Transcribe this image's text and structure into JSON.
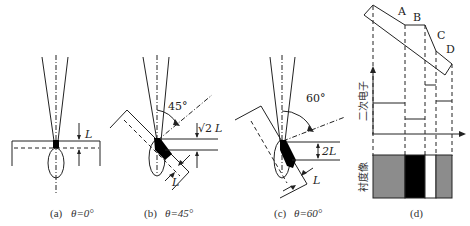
{
  "figure": {
    "panels": [
      {
        "id": "a",
        "caption_prefix": "(a)",
        "caption_theta": "θ=0°",
        "depth_label": "L"
      },
      {
        "id": "b",
        "caption_prefix": "(b)",
        "caption_theta": "θ=45°",
        "angle_label": "45°",
        "depth_label_top": "√2",
        "depth_label_top_var": "L",
        "depth_label_bottom": "L"
      },
      {
        "id": "c",
        "caption_prefix": "(c)",
        "caption_theta": "θ=60°",
        "angle_label": "60°",
        "depth_label_top": "2L",
        "depth_label_bottom": "L"
      },
      {
        "id": "d",
        "caption": "(d)",
        "surface_labels": [
          "A",
          "B",
          "C",
          "D"
        ],
        "axis_label_top": "二次电子",
        "axis_label_bottom": "衬度像"
      }
    ],
    "colors": {
      "line": "#222222",
      "gray_block": "#8c8c8c",
      "black_block": "#000000",
      "white_block": "#ffffff"
    }
  }
}
